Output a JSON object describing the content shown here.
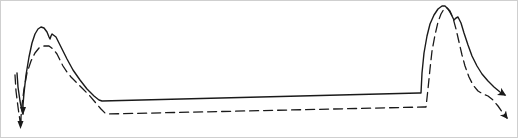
{
  "figure": {
    "background_color": "#ffffff",
    "border_color": "#cfcfcf",
    "width": 518,
    "height": 138
  },
  "chart_data": {
    "type": "line",
    "title": "",
    "subtitle": "",
    "xlabel": "",
    "ylabel": "",
    "xlim": [
      0,
      518
    ],
    "ylim": [
      138,
      0
    ],
    "grid": false,
    "axes_visible": false,
    "tick_labels_visible": false,
    "legend": {
      "visible": false,
      "position": "none",
      "entries": [
        {
          "name": "solid-curve",
          "style": "solid",
          "color": "#1a1a1a"
        },
        {
          "name": "dashed-curve",
          "style": "dashed",
          "color": "#1a1a1a"
        }
      ]
    },
    "annotations": [
      {
        "name": "right-arrowhead-solid",
        "x": 505,
        "y": 95,
        "type": "arrow-end"
      },
      {
        "name": "right-arrowhead-dashed",
        "x": 508,
        "y": 118,
        "type": "arrow-end"
      },
      {
        "name": "left-arrowhead-solid",
        "x": 22,
        "y": 112,
        "type": "arrow-end"
      },
      {
        "name": "left-arrowhead-dashed",
        "x": 19,
        "y": 126,
        "type": "arrow-end"
      }
    ],
    "series": [
      {
        "name": "solid-curve",
        "style": "solid",
        "color": "#1a1a1a",
        "linewidth": 1.4,
        "dasharray": "",
        "points": [
          [
            16,
            72
          ],
          [
            17,
            86
          ],
          [
            19,
            100
          ],
          [
            21,
            110
          ],
          [
            22,
            113
          ],
          [
            22,
            104
          ],
          [
            23,
            92
          ],
          [
            25,
            74
          ],
          [
            28,
            56
          ],
          [
            31,
            42
          ],
          [
            34,
            33
          ],
          [
            37,
            28
          ],
          [
            40,
            26
          ],
          [
            43,
            27
          ],
          [
            46,
            31
          ],
          [
            48,
            36
          ],
          [
            49,
            38
          ],
          [
            50,
            35
          ],
          [
            51,
            33
          ],
          [
            55,
            36
          ],
          [
            60,
            46
          ],
          [
            66,
            58
          ],
          [
            72,
            69
          ],
          [
            79,
            79
          ],
          [
            86,
            88
          ],
          [
            93,
            95
          ],
          [
            98,
            99
          ],
          [
            101,
            100
          ],
          [
            418,
            92
          ],
          [
            420,
            92
          ],
          [
            421,
            72
          ],
          [
            423,
            52
          ],
          [
            426,
            35
          ],
          [
            429,
            23
          ],
          [
            433,
            14
          ],
          [
            437,
            8
          ],
          [
            441,
            5
          ],
          [
            444,
            5
          ],
          [
            447,
            8
          ],
          [
            450,
            13
          ],
          [
            452,
            17
          ],
          [
            453,
            19
          ],
          [
            455,
            17
          ],
          [
            457,
            16
          ],
          [
            460,
            22
          ],
          [
            463,
            32
          ],
          [
            467,
            44
          ],
          [
            471,
            55
          ],
          [
            476,
            65
          ],
          [
            481,
            73
          ],
          [
            487,
            80
          ],
          [
            493,
            86
          ],
          [
            499,
            91
          ],
          [
            504,
            94
          ]
        ]
      },
      {
        "name": "dashed-curve",
        "style": "dashed",
        "color": "#1a1a1a",
        "linewidth": 1.3,
        "dasharray": "9 5",
        "points": [
          [
            14,
            74
          ],
          [
            15,
            90
          ],
          [
            17,
            106
          ],
          [
            19,
            120
          ],
          [
            20,
            126
          ],
          [
            20,
            116
          ],
          [
            21,
            104
          ],
          [
            23,
            88
          ],
          [
            26,
            72
          ],
          [
            30,
            60
          ],
          [
            34,
            52
          ],
          [
            38,
            47
          ],
          [
            43,
            45
          ],
          [
            48,
            45
          ],
          [
            52,
            48
          ],
          [
            56,
            53
          ],
          [
            59,
            59
          ],
          [
            62,
            65
          ],
          [
            66,
            71
          ],
          [
            70,
            76
          ],
          [
            75,
            81
          ],
          [
            81,
            87
          ],
          [
            88,
            94
          ],
          [
            94,
            101
          ],
          [
            100,
            108
          ],
          [
            104,
            112
          ],
          [
            107,
            113
          ],
          [
            423,
            106
          ],
          [
            425,
            106
          ],
          [
            427,
            88
          ],
          [
            429,
            68
          ],
          [
            431,
            50
          ],
          [
            434,
            34
          ],
          [
            437,
            21
          ],
          [
            440,
            13
          ],
          [
            443,
            8
          ],
          [
            446,
            7
          ],
          [
            449,
            10
          ],
          [
            452,
            17
          ],
          [
            455,
            28
          ],
          [
            458,
            41
          ],
          [
            461,
            54
          ],
          [
            464,
            65
          ],
          [
            468,
            76
          ],
          [
            472,
            84
          ],
          [
            477,
            90
          ],
          [
            482,
            93
          ],
          [
            487,
            95
          ],
          [
            492,
            99
          ],
          [
            497,
            105
          ],
          [
            502,
            112
          ],
          [
            506,
            117
          ]
        ]
      }
    ]
  }
}
